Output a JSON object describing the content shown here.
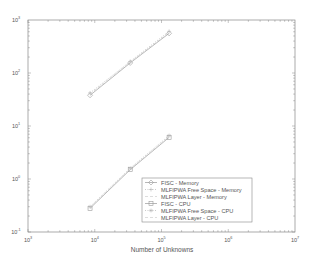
{
  "chart_data": {
    "type": "line",
    "title": "",
    "xlabel": "Number of Unknowns",
    "ylabel": "",
    "xscale": "log",
    "yscale": "log",
    "xlim": [
      1000,
      10000000
    ],
    "ylim": [
      0.1,
      1000
    ],
    "x_ticks": [
      {
        "base": "10",
        "exp": "3"
      },
      {
        "base": "10",
        "exp": "4"
      },
      {
        "base": "10",
        "exp": "5"
      },
      {
        "base": "10",
        "exp": "6"
      },
      {
        "base": "10",
        "exp": "7"
      }
    ],
    "y_ticks": [
      {
        "base": "10",
        "exp": "-1"
      },
      {
        "base": "10",
        "exp": "0"
      },
      {
        "base": "10",
        "exp": "1"
      },
      {
        "base": "10",
        "exp": "2"
      },
      {
        "base": "10",
        "exp": "3"
      }
    ],
    "grid": false,
    "legend_position": "lower right",
    "x": [
      8500,
      34000,
      130000
    ],
    "series": [
      {
        "name": "FISC - Memory",
        "values": [
          38,
          155,
          560
        ],
        "marker": "diamond",
        "line": "solid",
        "color": "#9a9a9a"
      },
      {
        "name": "MLFIPWA Free Space - Memory",
        "values": [
          42,
          165,
          610
        ],
        "marker": "plus",
        "line": "dotted",
        "color": "#b5b5b5"
      },
      {
        "name": "MLFIPWA Layer - Memory",
        "values": [
          40,
          160,
          585
        ],
        "marker": "none",
        "line": "dashed",
        "color": "#cfcfcf"
      },
      {
        "name": "FISC - CPU",
        "values": [
          0.28,
          1.5,
          6.1
        ],
        "marker": "square",
        "line": "solid",
        "color": "#9a9a9a"
      },
      {
        "name": "MLFIPWA Free Space - CPU",
        "values": [
          0.3,
          1.6,
          6.6
        ],
        "marker": "star",
        "line": "dotted",
        "color": "#b5b5b5"
      },
      {
        "name": "MLFIPWA Layer - CPU",
        "values": [
          0.29,
          1.55,
          6.3
        ],
        "marker": "none",
        "line": "dashed",
        "color": "#cfcfcf"
      }
    ]
  },
  "layout": {
    "plot": {
      "left": 28,
      "top": 20,
      "right": 295,
      "bottom": 232
    },
    "axis_color": "#888888"
  }
}
